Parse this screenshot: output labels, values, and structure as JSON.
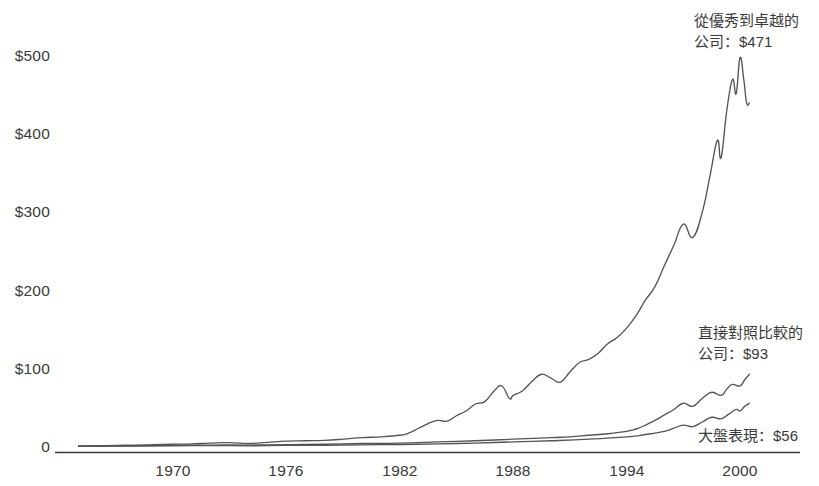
{
  "chart_data": {
    "type": "line",
    "title": "",
    "subtitle": "",
    "xlabel": "",
    "ylabel": "",
    "xlim": [
      1965,
      2000.5
    ],
    "ylim": [
      0,
      520
    ],
    "grid": false,
    "legend_position": "right-annotations",
    "x_ticks": [
      "1970",
      "1976",
      "1982",
      "1988",
      "1994",
      "2000"
    ],
    "x_tick_values": [
      1970,
      1976,
      1982,
      1988,
      1994,
      2000
    ],
    "y_ticks": [
      "0",
      "$100",
      "$200",
      "$300",
      "$400",
      "$500"
    ],
    "y_tick_values": [
      0,
      100,
      200,
      300,
      400,
      500
    ],
    "line_color": "#555555",
    "axis_color": "#3a3a3a",
    "series": [
      {
        "name": "從優秀到卓越的公司",
        "final_value": 471,
        "final_label": "$471",
        "x": [
          1965,
          1966,
          1967,
          1968,
          1969,
          1970,
          1971,
          1972,
          1973,
          1974,
          1975,
          1976,
          1977,
          1978,
          1979,
          1980,
          1981,
          1982,
          1982.5,
          1983,
          1983.5,
          1984,
          1984.5,
          1985,
          1985.5,
          1986,
          1986.5,
          1987,
          1987.4,
          1987.8,
          1988,
          1988.5,
          1989,
          1989.5,
          1990,
          1990.5,
          1991,
          1991.5,
          1992,
          1992.5,
          1993,
          1993.5,
          1994,
          1994.5,
          1995,
          1995.5,
          1996,
          1996.5,
          1997,
          1997.5,
          1998,
          1998.4,
          1998.8,
          1999,
          1999.3,
          1999.6,
          1999.8,
          2000,
          2000.2,
          2000.35,
          2000.5
        ],
        "y": [
          1,
          1.5,
          2,
          2.5,
          3,
          3.5,
          4,
          5,
          5.5,
          4.5,
          6,
          7.5,
          8,
          8.5,
          10,
          12,
          13,
          15,
          18,
          24,
          30,
          34,
          33,
          40,
          46,
          55,
          58,
          72,
          78,
          62,
          66,
          72,
          84,
          93,
          88,
          83,
          96,
          108,
          112,
          120,
          132,
          140,
          152,
          168,
          188,
          205,
          232,
          258,
          285,
          268,
          300,
          345,
          392,
          370,
          430,
          470,
          452,
          498,
          470,
          440,
          440
        ],
        "annotation": "從優秀到卓越的\n公司：$471"
      },
      {
        "name": "直接對照比較的公司",
        "final_value": 93,
        "final_label": "$93",
        "x": [
          1965,
          1968,
          1970,
          1972,
          1974,
          1976,
          1978,
          1980,
          1982,
          1984,
          1986,
          1988,
          1990,
          1991,
          1992,
          1993,
          1994,
          1994.5,
          1995,
          1995.5,
          1996,
          1996.5,
          1997,
          1997.5,
          1998,
          1998.5,
          1999,
          1999.3,
          1999.6,
          2000,
          2000.25,
          2000.5
        ],
        "y": [
          1,
          1.5,
          2,
          2.5,
          2.5,
          3,
          3.5,
          4.5,
          5,
          6.5,
          8,
          10,
          12,
          13,
          15,
          17,
          20,
          23,
          28,
          34,
          41,
          48,
          56,
          52,
          62,
          70,
          66,
          74,
          80,
          78,
          86,
          93
        ],
        "annotation": "直接對照比較的\n公司：$93"
      },
      {
        "name": "大盤表現",
        "final_value": 56,
        "final_label": "$56",
        "x": [
          1965,
          1968,
          1970,
          1972,
          1974,
          1976,
          1978,
          1980,
          1982,
          1984,
          1986,
          1988,
          1990,
          1992,
          1994,
          1995,
          1996,
          1996.5,
          1997,
          1997.5,
          1998,
          1998.5,
          1999,
          1999.4,
          1999.8,
          2000,
          2000.25,
          2000.5
        ],
        "y": [
          1,
          1.2,
          1.5,
          1.8,
          1.6,
          2,
          2.3,
          2.8,
          3.2,
          4,
          5,
          6.5,
          8,
          10,
          13,
          16,
          20,
          24,
          28,
          26,
          32,
          38,
          36,
          42,
          48,
          46,
          52,
          56
        ],
        "annotation": "大盤表現：$56"
      }
    ],
    "annotations": [
      {
        "id": "good-to-great",
        "lines": [
          "從優秀到卓越的",
          "公司：$471"
        ],
        "x_px": 694,
        "y_px": 10
      },
      {
        "id": "comparison",
        "lines": [
          "直接對照比較的",
          "公司：$93"
        ],
        "x_px": 698,
        "y_px": 322
      },
      {
        "id": "market",
        "lines": [
          "大盤表現：$56"
        ],
        "x_px": 698,
        "y_px": 425
      }
    ]
  }
}
